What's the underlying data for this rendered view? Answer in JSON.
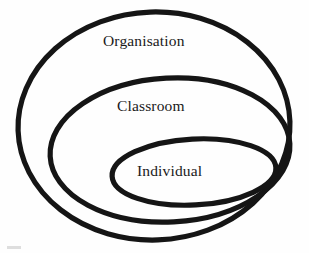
{
  "diagram": {
    "type": "nested-ellipses",
    "stroke_color": "#151515",
    "text_color": "#1a1a1a",
    "background_color": "#fefefe",
    "levels": [
      {
        "id": "organisation",
        "label": "Organisation",
        "order": 1,
        "scope": "outermost",
        "ellipse": {
          "cx": 154,
          "cy": 126,
          "rx": 136,
          "ry": 114,
          "rotate": -2
        }
      },
      {
        "id": "classroom",
        "label": "Classroom",
        "order": 2,
        "scope": "middle",
        "ellipse": {
          "cx": 170,
          "cy": 150,
          "rx": 120,
          "ry": 72,
          "rotate": -3
        }
      },
      {
        "id": "individual",
        "label": "Individual",
        "order": 3,
        "scope": "innermost",
        "ellipse": {
          "cx": 194,
          "cy": 172,
          "rx": 82,
          "ry": 33,
          "rotate": -3
        }
      }
    ]
  },
  "artifact": {
    "name": "scan-smudge",
    "color": "#d8d8d8"
  }
}
